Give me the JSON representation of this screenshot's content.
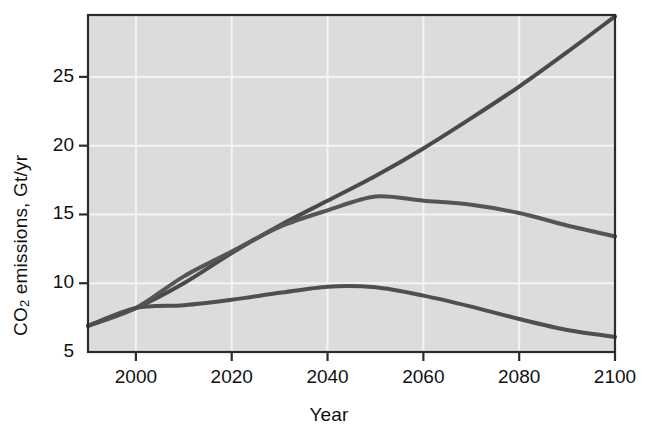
{
  "chart_data": {
    "type": "line",
    "title": "",
    "xlabel": "Year",
    "ylabel": "CO2 emissions, Gt/yr",
    "ylabel_parts": {
      "prefix": "CO",
      "subscript": "2",
      "suffix": " emissions, Gt/yr"
    },
    "xlim": [
      1990,
      2100
    ],
    "ylim": [
      5,
      29.5
    ],
    "xticks": [
      2000,
      2020,
      2040,
      2060,
      2080,
      2100
    ],
    "xtick_labels": [
      "2000",
      "2020",
      "2040",
      "2060",
      "2080",
      "2100"
    ],
    "yticks": [
      5,
      10,
      15,
      20,
      25
    ],
    "ytick_labels": [
      "5",
      "10",
      "15",
      "20",
      "25"
    ],
    "grid": true,
    "legend": "none",
    "plot_background": "#dcdcdc",
    "line_color": "#4a4a4a",
    "series": [
      {
        "name": "high-growth scenario",
        "color": "#4a4a4a",
        "x": [
          1990,
          2000,
          2010,
          2020,
          2030,
          2040,
          2050,
          2060,
          2070,
          2080,
          2090,
          2100
        ],
        "values": [
          6.9,
          8.2,
          10.0,
          12.2,
          14.2,
          16.0,
          17.8,
          19.8,
          22.0,
          24.3,
          26.8,
          29.4
        ]
      },
      {
        "name": "peak-then-decline scenario",
        "color": "#555555",
        "x": [
          1990,
          2000,
          2010,
          2020,
          2030,
          2040,
          2050,
          2060,
          2070,
          2080,
          2090,
          2100
        ],
        "values": [
          6.9,
          8.2,
          10.5,
          12.3,
          14.1,
          15.3,
          16.3,
          16.0,
          15.7,
          15.1,
          14.2,
          13.4
        ]
      },
      {
        "name": "low-emissions scenario",
        "color": "#4f4f4f",
        "x": [
          1990,
          2000,
          2010,
          2020,
          2030,
          2040,
          2050,
          2060,
          2070,
          2080,
          2090,
          2100
        ],
        "values": [
          6.9,
          8.2,
          8.4,
          8.8,
          9.3,
          9.75,
          9.7,
          9.1,
          8.3,
          7.4,
          6.6,
          6.1
        ]
      }
    ]
  }
}
